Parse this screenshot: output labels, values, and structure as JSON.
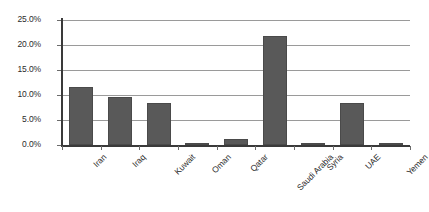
{
  "chart_data": {
    "type": "bar",
    "title": "",
    "subtitle": "",
    "xlabel": "",
    "ylabel": "",
    "categories": [
      "Iran",
      "Iraq",
      "Kuwait",
      "Oman",
      "Qatar",
      "Saudi Arabia",
      "Syria",
      "UAE",
      "Yemen"
    ],
    "values": [
      11.6,
      9.6,
      8.4,
      0.5,
      1.3,
      21.8,
      0.3,
      8.4,
      0.2
    ],
    "value_labels": [
      "11.6%",
      "9.6%",
      "8.4%",
      "0.5%",
      "1.3%",
      "21.8%",
      "0.3%",
      "8.4%",
      "0.2%"
    ],
    "ylim": [
      0,
      25
    ],
    "ytick_values": [
      25.0,
      20.0,
      15.0,
      10.0,
      5.0,
      0.0
    ],
    "ytick_labels": [
      "25.0%",
      "20.0%",
      "15.0%",
      "10.0%",
      "5.0%",
      "0.0%"
    ],
    "grid": true,
    "grid_axis": "y",
    "legend": false,
    "legend_position": "none",
    "annotations": [],
    "series": [
      {
        "name": "",
        "values": [
          11.6,
          9.6,
          8.4,
          0.5,
          1.3,
          21.8,
          0.3,
          8.4,
          0.2
        ]
      }
    ]
  },
  "style": {
    "bar_color": "#595959",
    "bar_border_color": "#4a4a4a",
    "gridline_color": "#9a9a9a",
    "axis_color": "#3a3a3a",
    "tick_color": "#6b6b6b",
    "text_color": "#2b2b2b",
    "background_color": "#ffffff"
  }
}
